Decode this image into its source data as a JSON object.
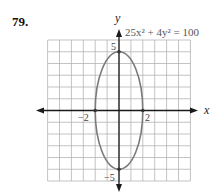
{
  "problem_number": "79.",
  "colors": {
    "grid": "#b4b4b4",
    "axes": "#1a1a1a",
    "curve": "#7a7a7a",
    "text": "#222222",
    "equation_text": "#555555"
  },
  "chart_data": {
    "type": "line",
    "title": "",
    "equation": "25x² + 4y² = 100",
    "curve": "ellipse",
    "center": [
      0,
      0
    ],
    "semi_axis_x": 2,
    "semi_axis_y": 5,
    "points": [
      {
        "x": 0,
        "y": 5,
        "label": "5"
      },
      {
        "x": 0,
        "y": -5,
        "label": "−5"
      },
      {
        "x": -2,
        "y": 0,
        "label": "−2"
      },
      {
        "x": 2,
        "y": 0,
        "label": "2"
      }
    ],
    "xlabel": "x",
    "ylabel": "y",
    "xlim": [
      -6,
      6
    ],
    "ylim": [
      -6,
      6
    ],
    "grid": true,
    "legend": "none"
  },
  "labels": {
    "x_axis": "x",
    "y_axis": "y",
    "equation": "25x² + 4y² = 100",
    "tick_pos_y": "5",
    "tick_neg_y": "−5",
    "tick_neg_x": "−2",
    "tick_pos_x": "2"
  }
}
